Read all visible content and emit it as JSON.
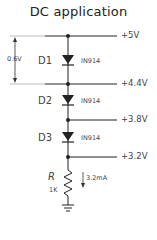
{
  "title": "DC application",
  "voltages": [
    {
      "label": "+5V"
    },
    {
      "label": "+4.4V"
    },
    {
      "label": "+3.8V"
    },
    {
      "label": "+3.2V"
    }
  ],
  "diodes": [
    {
      "ref": "D1",
      "part": "IN914"
    },
    {
      "ref": "D2",
      "part": "IN914"
    },
    {
      "ref": "D3",
      "part": "IN914"
    }
  ],
  "drop_annotation": "0.6V",
  "resistor": {
    "ref": "R",
    "value": "1K",
    "current": "3.2mA"
  },
  "colors": {
    "line": "#222222",
    "guide": "#999999",
    "text": "#444444"
  }
}
